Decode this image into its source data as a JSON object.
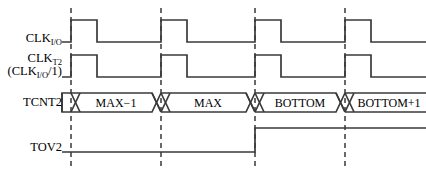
{
  "diagram": {
    "width": 426,
    "height": 175,
    "background_color": "#ffffff",
    "line_color": "#3a3a3a",
    "text_color": "#000000",
    "dashed_line_color": "#1a1a1a"
  },
  "signals": {
    "clk_io": {
      "name": "CLK",
      "subscript": "I/O",
      "type": "clock",
      "high_y": 20,
      "low_y": 42
    },
    "clk_t2": {
      "name": "CLK",
      "subscript": "T2",
      "qualifier": "(CLK",
      "qualifier_subscript": "I/O",
      "qualifier_tail": "/1)",
      "type": "clock",
      "high_y": 55,
      "low_y": 77
    },
    "tcnt2": {
      "name": "TCNT2",
      "type": "bus",
      "top_y": 93,
      "bottom_y": 112,
      "values": [
        "MAX−1",
        "MAX",
        "BOTTOM",
        "BOTTOM+1"
      ]
    },
    "tov2": {
      "name": "TOV2",
      "type": "level",
      "high_y": 128,
      "low_y": 152,
      "rise_at_edge": 3
    }
  },
  "timing": {
    "wave_start_x": 62,
    "wave_end_x": 426,
    "edge_x_positions": [
      71,
      161,
      255,
      345
    ],
    "pulse_width": 26,
    "period": 90,
    "bus_crossover_half_width": 9
  },
  "bus_cells": [
    {
      "label": "MAX−1",
      "left": 80,
      "right": 152,
      "center": 116
    },
    {
      "label": "MAX",
      "left": 170,
      "right": 246,
      "center": 208
    },
    {
      "label": "BOTTOM",
      "left": 264,
      "right": 336,
      "center": 300
    },
    {
      "label": "BOTTOM+1",
      "left": 354,
      "right": 426,
      "center": 390
    }
  ]
}
